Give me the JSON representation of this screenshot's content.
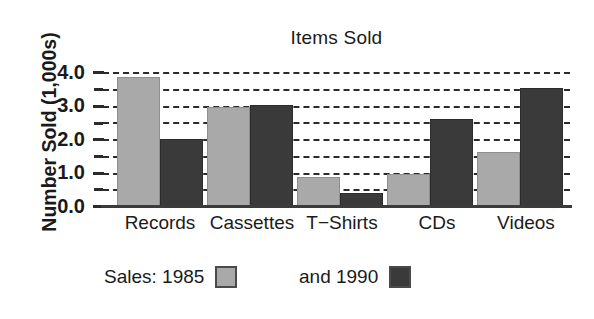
{
  "chart_data": {
    "type": "bar",
    "title": "Items Sold",
    "xlabel": "",
    "ylabel": "Number Sold (1,000s)",
    "categories": [
      "Records",
      "Cassettes",
      "T−Shirts",
      "CDs",
      "Videos"
    ],
    "series": [
      {
        "name": "Sales: 1985",
        "color": "#a9a9a9",
        "values": [
          3.85,
          2.97,
          0.88,
          0.97,
          1.62
        ]
      },
      {
        "name": "and 1990",
        "color": "#3a3a3a",
        "values": [
          2.0,
          3.02,
          0.4,
          2.6,
          3.52
        ]
      }
    ],
    "ylim": [
      0.0,
      4.0
    ],
    "ytick_labels": [
      "0.0",
      "1.0",
      "2.0",
      "3.0",
      "4.0"
    ],
    "ytick_values": [
      0.0,
      1.0,
      2.0,
      3.0,
      4.0
    ],
    "yminor_tick_values": [
      0.5,
      1.5,
      2.5,
      3.5
    ],
    "gridline_values": [
      0.5,
      1.0,
      1.5,
      2.0,
      2.5,
      3.0,
      3.5,
      4.0
    ],
    "grid": "horizontal-dashed",
    "legend_position": "bottom"
  },
  "legend": {
    "entries": [
      {
        "label": "Sales: 1985",
        "swatch": "light-gray-swatch"
      },
      {
        "label": "and 1990",
        "swatch": "dark-gray-swatch"
      }
    ]
  },
  "colors": {
    "series_1985": "#a9a9a9",
    "series_1990": "#3a3a3a",
    "axis": "#2b2b2b",
    "background": "#ffffff"
  }
}
